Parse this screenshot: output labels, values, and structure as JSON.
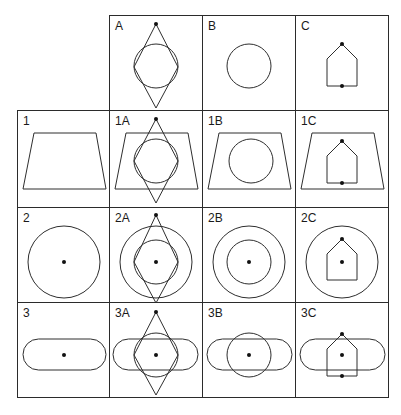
{
  "grid": {
    "origin": {
      "x": 17,
      "y": 15
    },
    "col_edges": [
      17,
      109,
      202,
      295,
      388
    ],
    "row_edges": [
      15,
      110,
      207,
      302,
      397
    ],
    "line_color": "#2b2b2b",
    "column_headers": [
      "A",
      "B",
      "C"
    ],
    "row_headers": [
      "1",
      "2",
      "3"
    ]
  },
  "cells": [
    {
      "id": "A",
      "row": 0,
      "col": 1,
      "label": "A",
      "shapes": [
        "diamond",
        "circle"
      ],
      "dots": [
        "top"
      ]
    },
    {
      "id": "B",
      "row": 0,
      "col": 2,
      "label": "B",
      "shapes": [
        "circle"
      ],
      "dots": []
    },
    {
      "id": "C",
      "row": 0,
      "col": 3,
      "label": "C",
      "shapes": [
        "house"
      ],
      "dots": [
        "house-apex",
        "house-bottom"
      ]
    },
    {
      "id": "1",
      "row": 1,
      "col": 0,
      "label": "1",
      "shapes": [
        "trapezoid"
      ],
      "dots": []
    },
    {
      "id": "1A",
      "row": 1,
      "col": 1,
      "label": "1A",
      "shapes": [
        "trapezoid",
        "diamond",
        "circle"
      ],
      "dots": [
        "top"
      ]
    },
    {
      "id": "1B",
      "row": 1,
      "col": 2,
      "label": "1B",
      "shapes": [
        "trapezoid",
        "circle"
      ],
      "dots": []
    },
    {
      "id": "1C",
      "row": 1,
      "col": 3,
      "label": "1C",
      "shapes": [
        "trapezoid",
        "house"
      ],
      "dots": [
        "house-apex",
        "house-bottom"
      ]
    },
    {
      "id": "2",
      "row": 2,
      "col": 0,
      "label": "2",
      "shapes": [
        "big-circle"
      ],
      "dots": [
        "center"
      ]
    },
    {
      "id": "2A",
      "row": 2,
      "col": 1,
      "label": "2A",
      "shapes": [
        "big-circle",
        "diamond",
        "circle"
      ],
      "dots": [
        "top",
        "center"
      ]
    },
    {
      "id": "2B",
      "row": 2,
      "col": 2,
      "label": "2B",
      "shapes": [
        "big-circle",
        "circle"
      ],
      "dots": [
        "center"
      ]
    },
    {
      "id": "2C",
      "row": 2,
      "col": 3,
      "label": "2C",
      "shapes": [
        "big-circle",
        "house"
      ],
      "dots": [
        "house-apex",
        "center"
      ]
    },
    {
      "id": "3",
      "row": 3,
      "col": 0,
      "label": "3",
      "shapes": [
        "stadium"
      ],
      "dots": [
        "center"
      ]
    },
    {
      "id": "3A",
      "row": 3,
      "col": 1,
      "label": "3A",
      "shapes": [
        "stadium",
        "diamond",
        "circle"
      ],
      "dots": [
        "top",
        "center"
      ]
    },
    {
      "id": "3B",
      "row": 3,
      "col": 2,
      "label": "3B",
      "shapes": [
        "stadium",
        "circle"
      ],
      "dots": [
        "center"
      ]
    },
    {
      "id": "3C",
      "row": 3,
      "col": 3,
      "label": "3C",
      "shapes": [
        "stadium",
        "house"
      ],
      "dots": [
        "house-apex",
        "center",
        "house-bottom"
      ]
    }
  ]
}
